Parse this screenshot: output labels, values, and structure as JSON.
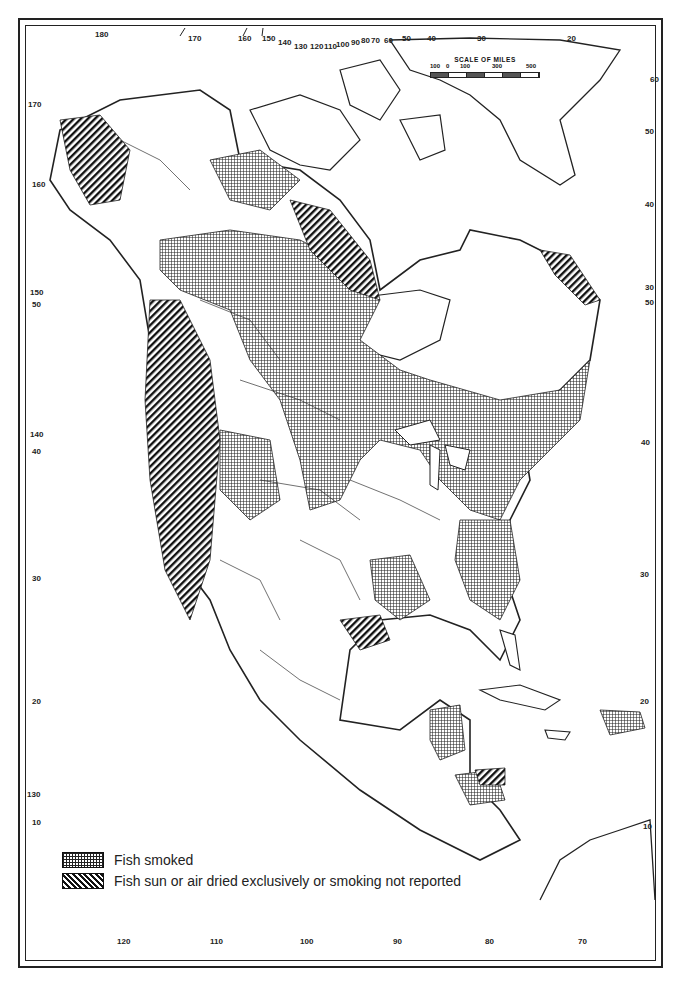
{
  "map": {
    "subject": "North America — fish preservation methods",
    "colors": {
      "ink": "#222222",
      "background": "#ffffff"
    }
  },
  "scale": {
    "title": "SCALE OF MILES",
    "labels": [
      "100",
      "0",
      "100",
      "300",
      "500"
    ]
  },
  "legend": {
    "items": [
      {
        "pattern": "crosshatch-grid",
        "label": "Fish smoked"
      },
      {
        "pattern": "diagonal-stripes",
        "label": "Fish sun or air dried exclusively or smoking not reported"
      }
    ]
  },
  "graticule": {
    "top_longitudes": [
      "180",
      "170",
      "160",
      "150",
      "140",
      "130",
      "120",
      "110",
      "100",
      "90",
      "80",
      "70",
      "60",
      "50",
      "40",
      "30",
      "20"
    ],
    "bottom_longitudes": [
      "120",
      "110",
      "100",
      "90",
      "80",
      "70"
    ],
    "left_labels": [
      "170",
      "160",
      "50",
      "150",
      "140",
      "40",
      "30",
      "20",
      "130",
      "10"
    ],
    "right_labels": [
      "60",
      "50",
      "40",
      "30",
      "50",
      "40",
      "30",
      "20",
      "10"
    ]
  }
}
